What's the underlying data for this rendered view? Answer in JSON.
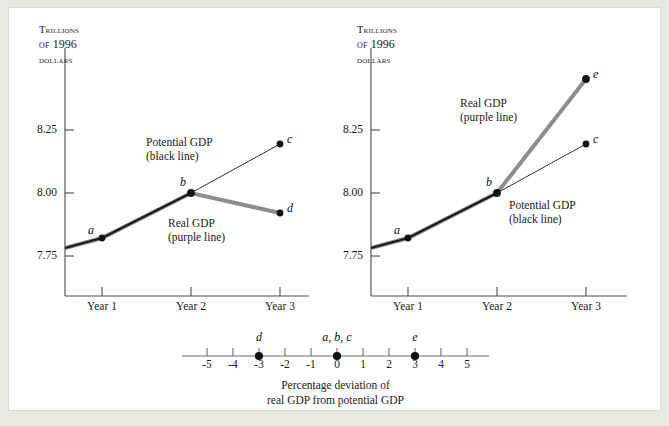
{
  "figure": {
    "background": "#ffffff",
    "page_background": "#e9e8e4",
    "border_color": "#dedbd6"
  },
  "colors": {
    "potential_line": "#1b1b1b",
    "real_line": "#8d8d8d",
    "axis": "#4a4a4a",
    "text": "#1b1b1b",
    "point": "#111111"
  },
  "panels": [
    {
      "id": "left",
      "axis_title_lines": [
        "Trillions",
        "of 1996",
        "dollars"
      ],
      "y_ticks": [
        "8.25",
        "8.00",
        "7.75"
      ],
      "x_ticks": [
        "Year 1",
        "Year 2",
        "Year 3"
      ],
      "annotations": [
        {
          "name": "potential-gdp-label",
          "lines": [
            "Potential GDP",
            "(black line)"
          ]
        },
        {
          "name": "real-gdp-label",
          "lines": [
            "Real GDP",
            "(purple line)"
          ]
        }
      ],
      "points": [
        {
          "label": "a",
          "year": "Year 1",
          "value": "7.82"
        },
        {
          "label": "b",
          "year": "Year 2",
          "value": "8.00"
        },
        {
          "label": "c",
          "year": "Year 3",
          "value": "8.19"
        },
        {
          "label": "d",
          "year": "Year 3",
          "value": "7.94"
        }
      ]
    },
    {
      "id": "right",
      "axis_title_lines": [
        "Trillions",
        "of 1996",
        "dollars"
      ],
      "y_ticks": [
        "8.25",
        "8.00",
        "7.75"
      ],
      "x_ticks": [
        "Year 1",
        "Year 2",
        "Year 3"
      ],
      "annotations": [
        {
          "name": "real-gdp-label",
          "lines": [
            "Real GDP",
            "(purple line)"
          ]
        },
        {
          "name": "potential-gdp-label",
          "lines": [
            "Potential GDP",
            "(black line)"
          ]
        }
      ],
      "points": [
        {
          "label": "a",
          "year": "Year 1",
          "value": "7.82"
        },
        {
          "label": "b",
          "year": "Year 2",
          "value": "8.00"
        },
        {
          "label": "c",
          "year": "Year 3",
          "value": "8.19"
        },
        {
          "label": "e",
          "year": "Year 3",
          "value": "8.44"
        }
      ]
    }
  ],
  "number_line": {
    "ticks": [
      "-5",
      "-4",
      "-3",
      "-2",
      "-1",
      "0",
      "1",
      "2",
      "3",
      "4",
      "5"
    ],
    "markers": [
      {
        "label": "d",
        "value": "-3"
      },
      {
        "label": "a, b, c",
        "value": "0"
      },
      {
        "label": "e",
        "value": "3"
      }
    ],
    "caption_lines": [
      "Percentage deviation of",
      "real GDP from potential GDP"
    ]
  },
  "chart_data": [
    {
      "type": "line",
      "id": "left-panel",
      "title": "",
      "xlabel": "",
      "ylabel": "Trillions of 1996 dollars",
      "categories": [
        "Year 1",
        "Year 2",
        "Year 3"
      ],
      "ylim": [
        7.63,
        8.47
      ],
      "yticks": [
        7.75,
        8.0,
        8.25
      ],
      "grid": false,
      "legend": "inline-annotation",
      "series": [
        {
          "name": "Potential GDP (black line)",
          "color": "#1b1b1b",
          "values": [
            7.82,
            8.0,
            8.19
          ],
          "point_labels": [
            "a",
            "b",
            "c"
          ]
        },
        {
          "name": "Real GDP (purple line)",
          "color": "#8d8d8d",
          "values": [
            7.82,
            8.0,
            7.94
          ],
          "point_labels": [
            "a",
            "b",
            "d"
          ]
        }
      ],
      "annotations": [
        "Potential GDP (black line)",
        "Real GDP (purple line)"
      ]
    },
    {
      "type": "line",
      "id": "right-panel",
      "title": "",
      "xlabel": "",
      "ylabel": "Trillions of 1996 dollars",
      "categories": [
        "Year 1",
        "Year 2",
        "Year 3"
      ],
      "ylim": [
        7.63,
        8.47
      ],
      "yticks": [
        7.75,
        8.0,
        8.25
      ],
      "grid": false,
      "legend": "inline-annotation",
      "series": [
        {
          "name": "Potential GDP (black line)",
          "color": "#1b1b1b",
          "values": [
            7.82,
            8.0,
            8.19
          ],
          "point_labels": [
            "a",
            "b",
            "c"
          ]
        },
        {
          "name": "Real GDP (purple line)",
          "color": "#8d8d8d",
          "values": [
            7.82,
            8.0,
            8.44
          ],
          "point_labels": [
            "a",
            "b",
            "e"
          ]
        }
      ],
      "annotations": [
        "Real GDP (purple line)",
        "Potential GDP (black line)"
      ]
    },
    {
      "type": "scatter",
      "id": "number-line",
      "title": "Percentage deviation of real GDP from potential GDP",
      "xlabel": "Percentage deviation of real GDP from potential GDP",
      "ylabel": "",
      "xlim": [
        -5.8,
        5.8
      ],
      "xticks": [
        -5,
        -4,
        -3,
        -2,
        -1,
        0,
        1,
        2,
        3,
        4,
        5
      ],
      "grid": false,
      "x": [
        -3,
        0,
        3
      ],
      "y": [
        0,
        0,
        0
      ],
      "point_labels": [
        "d",
        "a, b, c",
        "e"
      ]
    }
  ]
}
